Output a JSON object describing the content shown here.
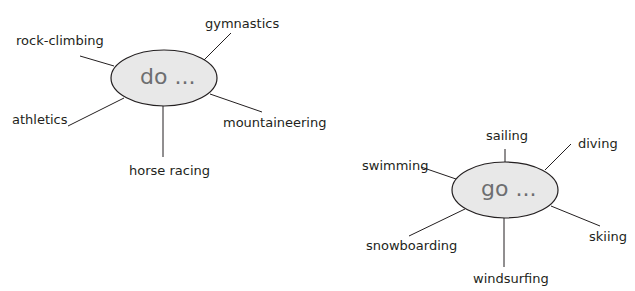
{
  "diagrams": [
    {
      "center_label": "do ...",
      "spokes": [
        "rock-climbing",
        "gymnastics",
        "athletics",
        "mountaineering",
        "horse racing"
      ]
    },
    {
      "center_label": "go ...",
      "spokes": [
        "swimming",
        "sailing",
        "diving",
        "snowboarding",
        "windsurfing",
        "skiing"
      ]
    }
  ],
  "colors": {
    "ellipse_fill": "#e8e8e8",
    "ellipse_stroke": "#231f20",
    "center_text": "#6d6e70",
    "label_text": "#231f20"
  }
}
